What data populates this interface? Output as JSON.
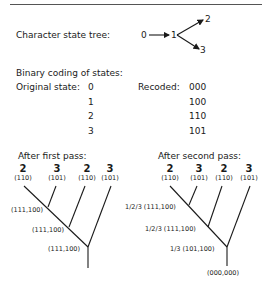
{
  "state_tree": {
    "label": "Character state tree:",
    "nodes": [
      "0",
      "1",
      "2",
      "3"
    ]
  },
  "binary_coding": {
    "title": "Binary coding of states:",
    "original_label": "Original state:",
    "recoded_label": "Recoded:",
    "rows": [
      {
        "original": "0",
        "recoded": "000"
      },
      {
        "original": "1",
        "recoded": "100"
      },
      {
        "original": "2",
        "recoded": "110"
      },
      {
        "original": "3",
        "recoded": "101"
      }
    ]
  },
  "first_pass": {
    "title": "After first pass:",
    "leaves": [
      {
        "state": "2",
        "code": "(110)"
      },
      {
        "state": "3",
        "code": "(101)"
      },
      {
        "state": "2",
        "code": "(110)"
      },
      {
        "state": "3",
        "code": "(101)"
      }
    ],
    "nodes": [
      "(111,100)",
      "(111,100)",
      "(111,100)"
    ]
  },
  "second_pass": {
    "title": "After second pass:",
    "leaves": [
      {
        "state": "2",
        "code": "(110)"
      },
      {
        "state": "3",
        "code": "(101)"
      },
      {
        "state": "2",
        "code": "(110)"
      },
      {
        "state": "3",
        "code": "(101)"
      }
    ],
    "nodes": [
      "1/2/3 (111,100)",
      "1/2/3 (111,100)",
      "1/3 (101,100)"
    ],
    "root": "(000,000)"
  }
}
